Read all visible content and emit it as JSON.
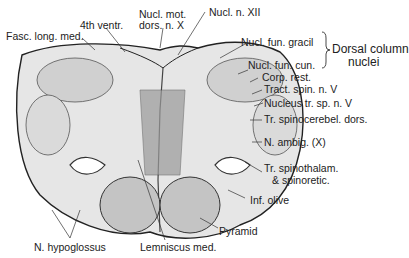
{
  "diagram": {
    "labels": {
      "fasc_long_med": "Fasc. long. med.",
      "fourth_ventr": "4th ventr.",
      "nucl_mot_1": "Nucl. mot.",
      "nucl_mot_2": "dors. n. X",
      "nucl_n_xii": "Nucl. n. XII",
      "nucl_fun_gracil": "Nucl. fun. gracil",
      "nucl_fun_cun": "Nucl. fun. cun.",
      "dorsal_col_1": "Dorsal column",
      "dorsal_col_2": "nuclei",
      "corp_rest": "Corp. rest.",
      "tract_spin": "Tract. spin. n. V",
      "nucleus_tr": "Nucleus tr. sp. n. V",
      "tr_spinocerebel": "Tr. spinocerebel. dors.",
      "n_ambig": "N. ambig. (X)",
      "tr_spinothal_1": "Tr. spinothalam.",
      "tr_spinothal_2": "& spinoretic.",
      "inf_olive": "Inf. olive",
      "pyramid": "Pyramid",
      "n_hypoglossus": "N. hypoglossus",
      "lemniscus_med": "Lemniscus med."
    },
    "colors": {
      "ink": "#222222",
      "fill": "#e8e8e8",
      "dark": "#555555"
    }
  }
}
